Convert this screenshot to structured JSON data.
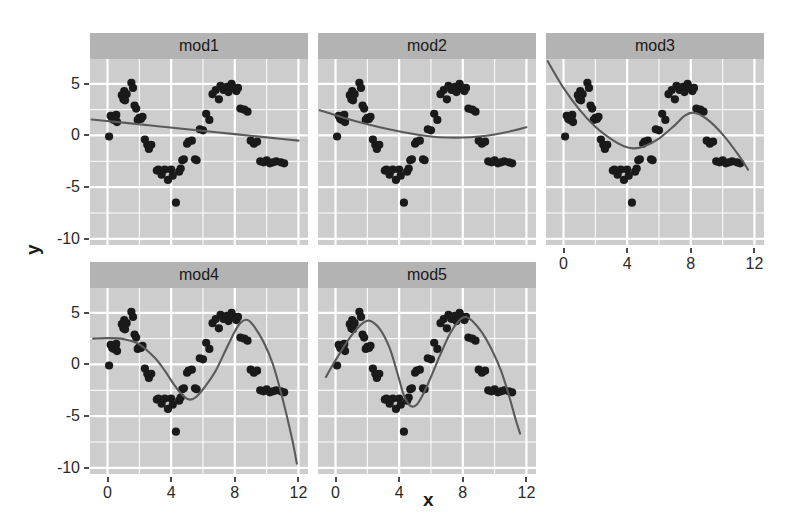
{
  "figure": {
    "xlabel": "x",
    "ylabel": "y",
    "background": "#ffffff",
    "panel_fill": "#cdcdcd",
    "strip_fill": "#b3b3b3",
    "grid_color": "#ffffff",
    "point_color": "#1a1a1a",
    "line_color": "#5a5a5a"
  },
  "axes": {
    "x_ticks": [
      "0",
      "4",
      "8",
      "12"
    ],
    "x_tick_values": [
      0,
      4,
      8,
      12
    ],
    "y_ticks": [
      "5",
      "0",
      "-5",
      "-10"
    ],
    "y_tick_values": [
      5,
      0,
      -5,
      -10
    ],
    "xlim": [
      -1.1,
      12.6
    ],
    "ylim": [
      -10.6,
      7.4
    ],
    "x_minor": [
      2,
      6,
      10
    ],
    "y_minor": [
      2.5,
      -2.5,
      -7.5
    ]
  },
  "chart_data": {
    "type": "scatter",
    "title": "",
    "subtitle": "",
    "xlabel": "x",
    "ylabel": "y",
    "grid": true,
    "legend": "none",
    "facet_layout": {
      "rows": 2,
      "cols": 3,
      "labels_position": "top"
    },
    "xlim": [
      -1.1,
      12.6
    ],
    "ylim": [
      -10.6,
      7.4
    ],
    "x_tick_labels": [
      "0",
      "4",
      "8",
      "12"
    ],
    "y_tick_labels": [
      "5",
      "0",
      "-5",
      "-10"
    ],
    "x": [
      0.1,
      0.2,
      0.3,
      0.4,
      0.5,
      0.55,
      0.6,
      0.9,
      1.0,
      1.05,
      1.1,
      1.2,
      1.5,
      1.6,
      1.7,
      1.8,
      1.9,
      2.0,
      2.1,
      2.2,
      2.35,
      2.5,
      2.6,
      2.75,
      3.1,
      3.2,
      3.4,
      3.6,
      3.8,
      4.0,
      4.1,
      4.3,
      4.5,
      4.6,
      4.7,
      4.8,
      5.0,
      5.1,
      5.3,
      5.5,
      5.6,
      5.8,
      6.0,
      6.2,
      6.4,
      6.6,
      6.8,
      7.0,
      7.1,
      7.3,
      7.5,
      7.6,
      7.8,
      7.9,
      8.0,
      8.1,
      8.2,
      8.35,
      8.6,
      8.8,
      9.0,
      9.2,
      9.4,
      9.6,
      9.8,
      10.0,
      10.2,
      10.4,
      10.6,
      10.9,
      11.1
    ],
    "y": [
      -0.1,
      1.9,
      1.6,
      1.5,
      1.7,
      2.0,
      1.3,
      3.9,
      3.5,
      4.3,
      3.4,
      4.0,
      5.1,
      4.6,
      2.9,
      2.6,
      1.5,
      1.7,
      1.6,
      1.8,
      -0.4,
      -0.9,
      -1.3,
      -0.9,
      -3.4,
      -3.3,
      -3.8,
      -3.3,
      -4.3,
      -3.3,
      -3.9,
      -6.5,
      -3.5,
      -3.2,
      -2.4,
      -2.3,
      -0.8,
      -0.6,
      -0.5,
      -2.3,
      -2.4,
      0.6,
      0.5,
      2.1,
      1.5,
      4.0,
      4.4,
      3.5,
      4.8,
      4.4,
      4.7,
      4.2,
      5.0,
      4.6,
      4.5,
      4.3,
      4.6,
      2.6,
      2.5,
      2.3,
      -0.5,
      -0.8,
      -0.6,
      -2.5,
      -2.6,
      -2.4,
      -2.7,
      -2.6,
      -2.5,
      -2.6,
      -2.7
    ],
    "series": [
      {
        "name": "mod1",
        "fit": "y ~ x (linear)",
        "curve": [
          [
            -1.0,
            1.55
          ],
          [
            1.0,
            1.24
          ],
          [
            3.0,
            0.92
          ],
          [
            5.0,
            0.6
          ],
          [
            7.0,
            0.29
          ],
          [
            9.0,
            -0.03
          ],
          [
            11.0,
            -0.34
          ],
          [
            12.0,
            -0.5
          ]
        ]
      },
      {
        "name": "mod2",
        "fit": "y ~ poly(x, 2)",
        "curve": [
          [
            -1.0,
            2.45
          ],
          [
            0.5,
            1.72
          ],
          [
            2.0,
            1.09
          ],
          [
            3.5,
            0.55
          ],
          [
            5.0,
            0.11
          ],
          [
            6.0,
            -0.1
          ],
          [
            7.0,
            -0.2
          ],
          [
            8.0,
            -0.2
          ],
          [
            9.0,
            -0.1
          ],
          [
            10.0,
            0.1
          ],
          [
            11.0,
            0.4
          ],
          [
            12.0,
            0.8
          ]
        ]
      },
      {
        "name": "mod3",
        "fit": "y ~ poly(x, 3)",
        "curve": [
          [
            -1.0,
            7.2
          ],
          [
            0.0,
            4.6
          ],
          [
            1.0,
            2.5
          ],
          [
            2.0,
            0.85
          ],
          [
            3.0,
            -0.35
          ],
          [
            3.8,
            -1.05
          ],
          [
            4.4,
            -1.25
          ],
          [
            5.0,
            -1.1
          ],
          [
            6.0,
            -0.3
          ],
          [
            7.0,
            1.0
          ],
          [
            7.6,
            1.9
          ],
          [
            8.2,
            2.2
          ],
          [
            9.0,
            1.6
          ],
          [
            10.0,
            0.1
          ],
          [
            11.0,
            -1.9
          ],
          [
            11.6,
            -3.3
          ]
        ]
      },
      {
        "name": "mod4",
        "fit": "y ~ poly(x, 4)",
        "curve": [
          [
            -0.9,
            2.5
          ],
          [
            0.0,
            2.55
          ],
          [
            1.0,
            2.45
          ],
          [
            2.0,
            1.95
          ],
          [
            3.0,
            0.6
          ],
          [
            3.6,
            -0.6
          ],
          [
            4.2,
            -2.0
          ],
          [
            4.8,
            -3.1
          ],
          [
            5.2,
            -3.4
          ],
          [
            5.6,
            -3.1
          ],
          [
            6.2,
            -2.0
          ],
          [
            6.8,
            -0.6
          ],
          [
            7.4,
            1.3
          ],
          [
            8.0,
            3.2
          ],
          [
            8.4,
            4.1
          ],
          [
            8.8,
            4.3
          ],
          [
            9.2,
            3.7
          ],
          [
            9.8,
            2.2
          ],
          [
            10.4,
            0.0
          ],
          [
            11.0,
            -3.3
          ],
          [
            11.6,
            -7.2
          ],
          [
            11.9,
            -9.6
          ]
        ]
      },
      {
        "name": "mod5",
        "fit": "y ~ poly(x, 5)",
        "curve": [
          [
            -0.6,
            -1.2
          ],
          [
            0.0,
            0.4
          ],
          [
            0.6,
            1.9
          ],
          [
            1.2,
            3.2
          ],
          [
            1.8,
            4.1
          ],
          [
            2.2,
            4.2
          ],
          [
            2.8,
            3.4
          ],
          [
            3.4,
            1.6
          ],
          [
            3.9,
            -0.9
          ],
          [
            4.3,
            -3.0
          ],
          [
            4.7,
            -4.0
          ],
          [
            5.1,
            -3.9
          ],
          [
            5.5,
            -2.9
          ],
          [
            6.0,
            -1.2
          ],
          [
            6.6,
            1.0
          ],
          [
            7.2,
            3.0
          ],
          [
            7.8,
            4.3
          ],
          [
            8.2,
            4.6
          ],
          [
            8.6,
            4.2
          ],
          [
            9.2,
            3.1
          ],
          [
            9.8,
            1.5
          ],
          [
            10.4,
            -0.6
          ],
          [
            10.9,
            -3.0
          ],
          [
            11.3,
            -5.2
          ],
          [
            11.6,
            -6.7
          ]
        ]
      }
    ]
  },
  "facets": [
    {
      "label": "mod1"
    },
    {
      "label": "mod2"
    },
    {
      "label": "mod3"
    },
    {
      "label": "mod4"
    },
    {
      "label": "mod5"
    }
  ]
}
